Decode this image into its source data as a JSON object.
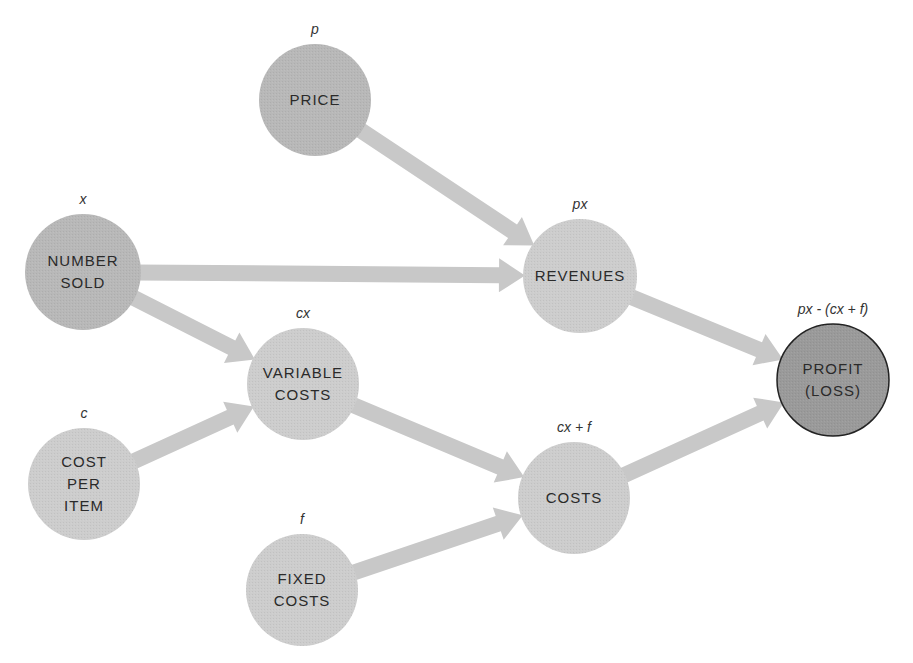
{
  "colors": {
    "node_fill_light": "#cdcdcd",
    "node_fill_mid": "#b8b8b8",
    "node_fill_result": "#9a9a9a",
    "node_stroke_result": "#222222",
    "arrow_fill": "#c8c8c8",
    "text": "#2a2a2a"
  },
  "nodes": [
    {
      "id": "price",
      "lines": [
        "PRICE"
      ],
      "formula": "p",
      "cx": 315,
      "cy": 100,
      "r": 56,
      "shade": "mid"
    },
    {
      "id": "number_sold",
      "lines": [
        "NUMBER",
        "SOLD"
      ],
      "formula": "x",
      "cx": 83,
      "cy": 272,
      "r": 58,
      "shade": "mid"
    },
    {
      "id": "revenues",
      "lines": [
        "REVENUES"
      ],
      "formula": "px",
      "cx": 580,
      "cy": 276,
      "r": 57,
      "shade": "light"
    },
    {
      "id": "variable_costs",
      "lines": [
        "VARIABLE",
        "COSTS"
      ],
      "formula": "cx",
      "cx": 303,
      "cy": 384,
      "r": 56,
      "shade": "light"
    },
    {
      "id": "cost_per_item",
      "lines": [
        "COST",
        "PER",
        "ITEM"
      ],
      "formula": "c",
      "cx": 84,
      "cy": 484,
      "r": 56,
      "shade": "light"
    },
    {
      "id": "costs",
      "lines": [
        "COSTS"
      ],
      "formula": "cx + f",
      "cx": 574,
      "cy": 498,
      "r": 56,
      "shade": "light"
    },
    {
      "id": "fixed_costs",
      "lines": [
        "FIXED",
        "COSTS"
      ],
      "formula": "f",
      "cx": 302,
      "cy": 590,
      "r": 56,
      "shade": "light"
    },
    {
      "id": "profit",
      "lines": [
        "PROFIT",
        "(LOSS)"
      ],
      "formula": "px - (cx + f)",
      "cx": 833,
      "cy": 380,
      "r": 56,
      "shade": "result"
    }
  ],
  "edges": [
    {
      "from": "price",
      "to": "revenues"
    },
    {
      "from": "number_sold",
      "to": "revenues"
    },
    {
      "from": "number_sold",
      "to": "variable_costs"
    },
    {
      "from": "cost_per_item",
      "to": "variable_costs"
    },
    {
      "from": "variable_costs",
      "to": "costs"
    },
    {
      "from": "fixed_costs",
      "to": "costs"
    },
    {
      "from": "revenues",
      "to": "profit"
    },
    {
      "from": "costs",
      "to": "profit"
    }
  ]
}
